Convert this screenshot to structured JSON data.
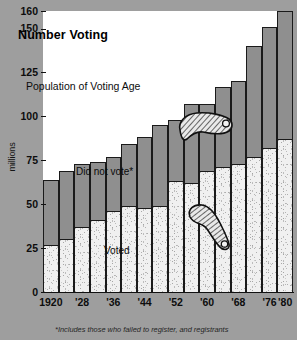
{
  "chart_data": {
    "type": "bar",
    "title": "Number Voting",
    "subtitle": "Population of Voting Age",
    "xlabel": "",
    "ylabel": "millions",
    "ylim": [
      0,
      160
    ],
    "yticks": [
      0,
      25,
      50,
      75,
      100,
      125,
      150,
      160
    ],
    "grid": false,
    "legend_position": "in-plot annotations",
    "stacked": true,
    "categories": [
      "1920",
      "1924",
      "1928",
      "1932",
      "1936",
      "1940",
      "1944",
      "1948",
      "1952",
      "1956",
      "1960",
      "1964",
      "1968",
      "1972",
      "1976",
      "1980"
    ],
    "tick_labels": [
      "1920",
      "'28",
      "'36",
      "'44",
      "'52",
      "'60",
      "'68",
      "'76",
      "'80"
    ],
    "tick_label_categories": [
      "1920",
      "1928",
      "1936",
      "1944",
      "1952",
      "1960",
      "1968",
      "1976",
      "1980"
    ],
    "series": [
      {
        "name": "Voted",
        "color": "#f0f0f0",
        "values": [
          27,
          30,
          37,
          41,
          46,
          49,
          48,
          49,
          63,
          62,
          69,
          71,
          73,
          77,
          82,
          87
        ]
      },
      {
        "name": "Did not vote",
        "color": "#8f8f8f",
        "values": [
          37,
          39,
          36,
          33,
          31,
          35,
          40,
          46,
          35,
          45,
          38,
          46,
          47,
          63,
          69,
          73
        ]
      }
    ],
    "totals": [
      64,
      69,
      73,
      74,
      77,
      84,
      88,
      95,
      98,
      107,
      107,
      117,
      120,
      140,
      151,
      160
    ],
    "annotations": [
      {
        "name": "title",
        "text": "Number Voting"
      },
      {
        "name": "population-label",
        "text": "Population of Voting Age"
      },
      {
        "name": "did-not-vote-label",
        "text": "Did not vote*"
      },
      {
        "name": "voted-label",
        "text": "Voted"
      }
    ],
    "footnote": "*Includes those who failed to register, and registrants"
  },
  "figure": {
    "title": "Number Voting",
    "subtitle": "Population of Voting Age",
    "y_axis_label": "millions",
    "did_not_vote_label": "Did not vote*",
    "voted_label": "Voted",
    "footnote": "*Includes those who failed to register, and registrants",
    "background_color": "#9e9e9e",
    "plot_background": "#ffffff",
    "bar_top_color": "#8f8f8f",
    "bar_bottom_color": "#f0f0f0"
  }
}
